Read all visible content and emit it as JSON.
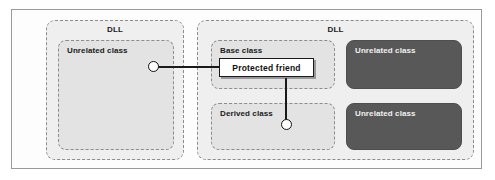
{
  "diagram": {
    "colors": {
      "frame_border": "#9a9a9a",
      "dll_fill": "#efefef",
      "dll_border": "#8c8c8c",
      "class_light_fill": "#e3e3e3",
      "class_dark_fill": "#585858",
      "callout_border": "#1a1a1a",
      "connector": "#1a1a1a",
      "text_dark": "#1a1a1a",
      "text_light": "#f2f2f2"
    },
    "left_dll": {
      "label": "DLL",
      "classes": [
        {
          "label": "Unrelated class",
          "style": "light"
        }
      ]
    },
    "right_dll": {
      "label": "DLL",
      "classes": [
        {
          "label": "Base class",
          "style": "light"
        },
        {
          "label": "Unrelated class",
          "style": "dark"
        },
        {
          "label": "Derived class",
          "style": "light"
        },
        {
          "label": "Unrelated class",
          "style": "dark"
        }
      ]
    },
    "member": {
      "label": "Protected friend"
    },
    "connectors": {
      "left_endpoint_name": "access-point-unrelated-class",
      "bottom_endpoint_name": "access-point-derived-class"
    }
  }
}
